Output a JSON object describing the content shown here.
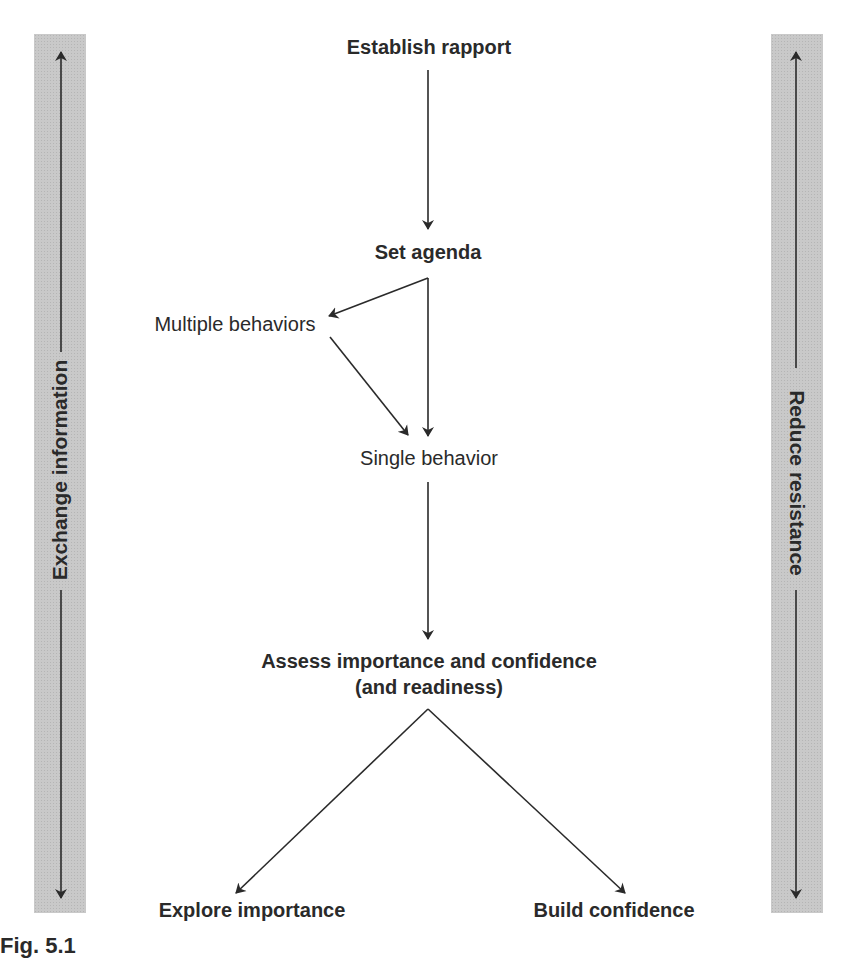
{
  "diagram": {
    "side_labels": {
      "left": "Exchange information",
      "right": "Reduce resistance"
    },
    "nodes": {
      "establish_rapport": "Establish rapport",
      "set_agenda": "Set agenda",
      "multiple_behaviors": "Multiple behaviors",
      "single_behavior": "Single behavior",
      "assess_line1": "Assess importance and confidence",
      "assess_line2": "(and readiness)",
      "explore_importance": "Explore importance",
      "build_confidence": "Build confidence"
    },
    "edges": [
      {
        "from": "Establish rapport",
        "to": "Set agenda"
      },
      {
        "from": "Set agenda",
        "to": "Multiple behaviors"
      },
      {
        "from": "Set agenda",
        "to": "Single behavior"
      },
      {
        "from": "Multiple behaviors",
        "to": "Single behavior"
      },
      {
        "from": "Single behavior",
        "to": "Assess importance and confidence (and readiness)"
      },
      {
        "from": "Assess importance and confidence (and readiness)",
        "to": "Explore importance"
      },
      {
        "from": "Assess importance and confidence (and readiness)",
        "to": "Build confidence"
      }
    ],
    "caption": "Fig. 5.1",
    "colors": {
      "bar_fill": "#c9c9c9",
      "ink": "#2a2a2a"
    }
  }
}
